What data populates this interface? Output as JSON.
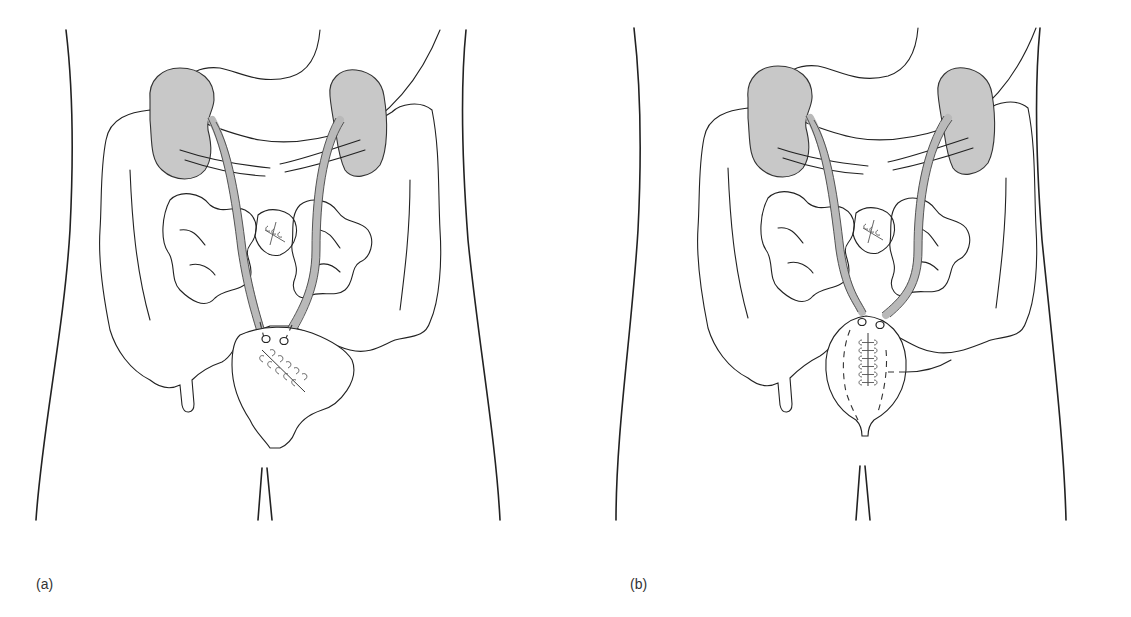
{
  "figure": {
    "panels": [
      {
        "id": "a",
        "label": "(a)",
        "depicts": "ureters implanted into sigmoid colon with sutured colotomy"
      },
      {
        "id": "b",
        "label": "(b)",
        "depicts": "ureters implanted into a reconstructed rectosigmoid pouch with vertical suture line"
      }
    ],
    "colors": {
      "line": "#222222",
      "kidney_fill": "#c8c8c8",
      "ureter_fill": "#b9b9b9",
      "background": "#ffffff"
    }
  }
}
